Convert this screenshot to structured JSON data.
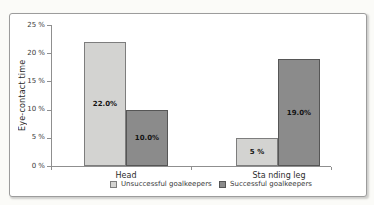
{
  "chart_data": {
    "type": "bar",
    "title": "",
    "xlabel": "",
    "ylabel": "Eye-contact time",
    "categories": [
      "Head",
      "Sta nding leg"
    ],
    "series": [
      {
        "name": "Unsuccessful goalkeepers",
        "values": [
          22.0,
          5
        ],
        "labels": [
          "22.0%",
          "5 %"
        ],
        "color": "#d3d3d1",
        "border_color": "#7d7d7d"
      },
      {
        "name": "Successful goalkeepers",
        "values": [
          10.0,
          19.0
        ],
        "labels": [
          "10.0%",
          "19.0%"
        ],
        "color": "#8b8b8b",
        "border_color": "#565656"
      }
    ],
    "ylim": [
      0,
      25
    ],
    "ytick_values": [
      0,
      5,
      10,
      15,
      20,
      25
    ],
    "ytick_labels": [
      "0 %",
      "5 %",
      "10 %",
      "15 %",
      "20 %",
      "25 %"
    ],
    "grid": false,
    "legend_position": "bottom"
  },
  "colors": {
    "axis": "#8f8f8f",
    "frame_border": "#9c9c9c",
    "background": "#ffffff",
    "page_background": "#fbfbf8",
    "text": "#2c2c2c"
  }
}
